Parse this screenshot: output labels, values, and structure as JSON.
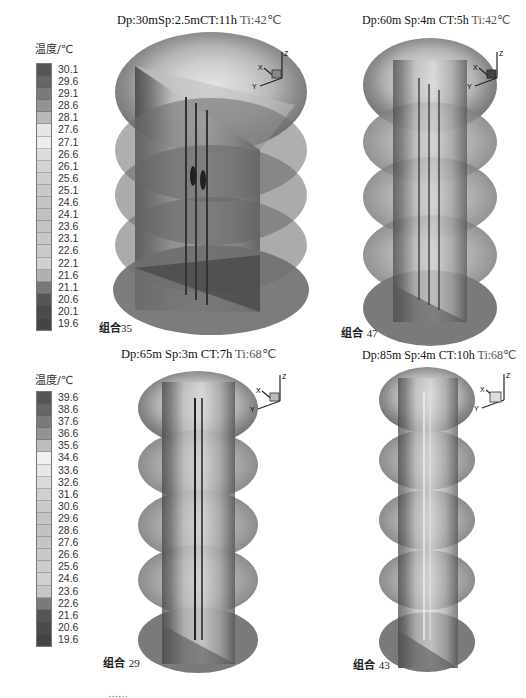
{
  "legends": [
    {
      "title": "温度/℃",
      "values": [
        "30.1",
        "29.6",
        "29.1",
        "28.6",
        "28.1",
        "27.6",
        "27.1",
        "26.6",
        "26.1",
        "25.6",
        "25.1",
        "24.6",
        "24.1",
        "23.6",
        "23.1",
        "22.6",
        "22.1",
        "21.6",
        "21.1",
        "20.6",
        "20.1",
        "19.6"
      ],
      "colors": [
        "#555555",
        "#666666",
        "#7a7a7a",
        "#939393",
        "#b9b9b9",
        "#e6e6e6",
        "#ededed",
        "#dddddd",
        "#d3d3d3",
        "#cdcdcd",
        "#c8c8c8",
        "#c4c4c4",
        "#c0c0c0",
        "#c3c3c3",
        "#c7c7c7",
        "#cbcbcb",
        "#cfcfcf",
        "#b0b0b0",
        "#777777",
        "#555555",
        "#4a4a4a",
        "#444444"
      ]
    },
    {
      "title": "温度/℃",
      "values": [
        "39.6",
        "38.6",
        "37.6",
        "36.6",
        "35.6",
        "34.6",
        "33.6",
        "32.6",
        "31.6",
        "30.6",
        "29.6",
        "28.6",
        "27.6",
        "26.6",
        "25.6",
        "24.6",
        "23.6",
        "22.6",
        "21.6",
        "20.6",
        "19.6"
      ],
      "colors": [
        "#555555",
        "#666666",
        "#7a7a7a",
        "#939393",
        "#bdbdbd",
        "#f0f0f0",
        "#e6e6e6",
        "#d9d9d9",
        "#d0d0d0",
        "#cacaca",
        "#c4c4c4",
        "#c1c1c1",
        "#c4c4c4",
        "#c8c8c8",
        "#cccccc",
        "#d0d0d0",
        "#c6c6c6",
        "#7a7a7a",
        "#555555",
        "#4a4a4a",
        "#444444"
      ]
    }
  ],
  "panels": [
    {
      "title": "Dp:30mSp:2.5mCT:11h",
      "ti": "Ti:42℃",
      "label": "组合",
      "num": "35"
    },
    {
      "title": "Dp:60m Sp:4m CT:5h",
      "ti": "Ti:42℃",
      "label": "组合",
      "num": "47"
    },
    {
      "title": "Dp:65m Sp:3m CT:7h",
      "ti": "Ti:68℃",
      "label": "组合",
      "num": "29"
    },
    {
      "title": "Dp:85m Sp:4m CT:10h",
      "ti": "Ti:68℃",
      "label": "组合",
      "num": "43"
    }
  ],
  "axes": {
    "x": "X",
    "y": "Y",
    "z": "Z"
  },
  "caption": "……"
}
